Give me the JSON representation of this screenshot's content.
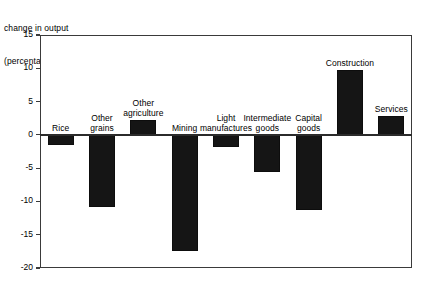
{
  "chart_data": {
    "type": "bar",
    "title": "change in output (percentage)",
    "title_lines": [
      "change in output",
      "(percentage)"
    ],
    "xlabel": "",
    "ylabel": "change in output (percentage)",
    "ylim": [
      -20,
      15
    ],
    "yticks": [
      15,
      10,
      5,
      0,
      -5,
      -10,
      -15,
      -20
    ],
    "ytick_labels": [
      "15",
      "10",
      "5",
      "0",
      "-5",
      "-10",
      "-15",
      "-20"
    ],
    "grid": false,
    "legend": false,
    "bar_color": "#151515",
    "frame_color": "#3a3a3a",
    "categories": [
      "Rice",
      "Other grains",
      "Other agriculture",
      "Mining",
      "Light manufactures",
      "Intermediate goods",
      "Capital goods",
      "Construction",
      "Services"
    ],
    "category_label_lines": [
      [
        "Rice"
      ],
      [
        "Other",
        "grains"
      ],
      [
        "Other",
        "agriculture"
      ],
      [
        "Mining"
      ],
      [
        "Light",
        "manufactures"
      ],
      [
        "Intermediate",
        "goods"
      ],
      [
        "Capital",
        "goods"
      ],
      [
        "Construction"
      ],
      [
        "Services"
      ]
    ],
    "values": [
      -1.5,
      -10.8,
      2.3,
      -17.5,
      -1.8,
      -5.6,
      -11.3,
      9.8,
      2.8
    ]
  }
}
